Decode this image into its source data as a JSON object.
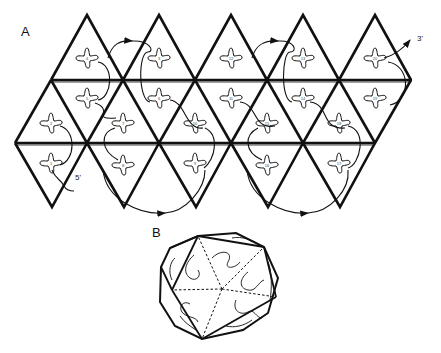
{
  "figure": {
    "panel_a": {
      "label": "A",
      "end_3prime": "3'",
      "end_5prime": "5'"
    },
    "panel_b": {
      "label": "B"
    },
    "colors": {
      "stroke": "#111111",
      "background": "#ffffff"
    },
    "net": {
      "apex_x": [
        87,
        159,
        231,
        303,
        375
      ],
      "top_y": 15,
      "line1_y": 80,
      "line2_y": 143,
      "bottom_y": 207,
      "bottom_x": [
        52,
        124,
        196,
        268,
        340
      ]
    },
    "triangle_numbers": {
      "top_row": [
        "4",
        "3",
        "12",
        "13",
        "20"
      ],
      "upper_middle_row": [
        "1",
        "5",
        "6",
        "11",
        "14",
        "19"
      ],
      "lower_middle_row": [
        "2",
        "7",
        "10",
        "15",
        "18"
      ],
      "bottom_row": [
        "1",
        "8",
        "9",
        "16",
        "17"
      ]
    }
  }
}
